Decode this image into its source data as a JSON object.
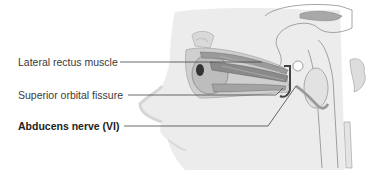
{
  "diagram": {
    "colors": {
      "background": "#ffffff",
      "skin": "#e9e9e9",
      "skin_shadow": "#d4d4d4",
      "muscle": "#8f8f8f",
      "muscle_dark": "#5a5a5a",
      "outline": "#9a9a9a",
      "leader_line": "#444444",
      "label_text": "#3a3a3a"
    },
    "labels": [
      {
        "id": "lateral-rectus",
        "text": "Lateral rectus muscle",
        "bold": false
      },
      {
        "id": "superior-orbital-fissure",
        "text": "Superior orbital fissure",
        "bold": false
      },
      {
        "id": "abducens-nerve",
        "text": "Abducens nerve (VI)",
        "bold": true
      }
    ]
  }
}
